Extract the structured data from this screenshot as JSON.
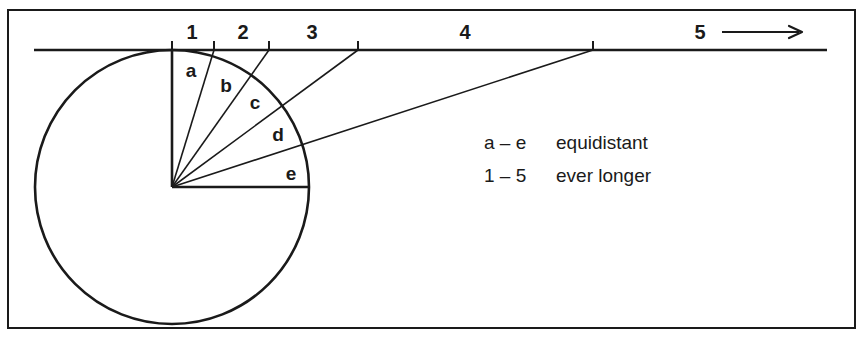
{
  "figure": {
    "type": "geometry-diagram",
    "width": 865,
    "height": 338,
    "frame": {
      "x": 8,
      "y": 10,
      "width": 847,
      "height": 318,
      "stroke": "#1a1a1a"
    },
    "ink_color": "#1a1a1a",
    "background": "#ffffff"
  },
  "circle": {
    "center_x": 172,
    "center_y": 187,
    "radius": 137,
    "label": "circle"
  },
  "axis": {
    "label": "horizontal-ray",
    "y": 50,
    "x_start": 34,
    "x_end": 827,
    "arrow": {
      "x_start": 722,
      "x_end": 802,
      "y": 32
    }
  },
  "rays": [
    {
      "id": "a",
      "letter": "a",
      "tick_number": "1",
      "tick_x": 172,
      "letter_x": 191,
      "letter_y": 70,
      "num_x": 192,
      "num_y": 42
    },
    {
      "id": "b",
      "letter": "b",
      "tick_number": "2",
      "tick_x": 214,
      "letter_x": 226,
      "letter_y": 85,
      "num_x": 243,
      "num_y": 42
    },
    {
      "id": "c",
      "letter": "c",
      "tick_number": "3",
      "tick_x": 269,
      "letter_x": 255,
      "letter_y": 102,
      "num_x": 312,
      "num_y": 42
    },
    {
      "id": "d",
      "letter": "d",
      "tick_number": "4",
      "tick_x": 358,
      "letter_x": 278,
      "letter_y": 134,
      "num_x": 465,
      "num_y": 42
    },
    {
      "id": "e",
      "letter": "e",
      "tick_number": "5",
      "tick_x": 593,
      "letter_x": 291,
      "letter_y": 173,
      "num_x": 700,
      "num_y": 42
    }
  ],
  "legend": {
    "rows": [
      {
        "key": "a – e",
        "value": "equidistant",
        "x": 484,
        "y": 132
      },
      {
        "key": "1 – 5",
        "value": "ever longer",
        "x": 484,
        "y": 165
      }
    ]
  },
  "chart_data": {
    "type": "line",
    "title": "",
    "angles_deg_from_vertical": [
      0,
      18,
      36,
      54,
      72
    ],
    "sector_labels": [
      "a",
      "b",
      "c",
      "d",
      "e"
    ],
    "segment_labels": [
      "1",
      "2",
      "3",
      "4",
      "5"
    ],
    "intersection_x": [
      172,
      214,
      269,
      358,
      593
    ],
    "xlabel": "",
    "ylabel": "",
    "grid": false
  }
}
